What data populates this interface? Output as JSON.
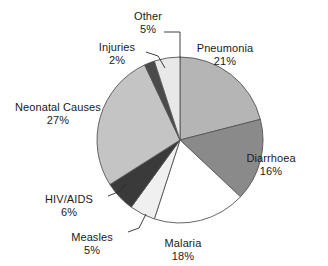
{
  "chart_data": {
    "type": "pie",
    "title": "",
    "subtitle": "",
    "xlabel": "",
    "ylabel": "",
    "legend_position": "none",
    "grid": false,
    "labels_show_percent": true,
    "categories": [
      "Pneumonia",
      "Diarrhoea",
      "Malaria",
      "Measles",
      "HIV/AIDS",
      "Neonatal Causes",
      "Injuries",
      "Other"
    ],
    "values": [
      21,
      16,
      18,
      5,
      6,
      27,
      2,
      5
    ],
    "units": "%",
    "total": 100,
    "start_angle_deg": 0,
    "direction": "clockwise",
    "slices": [
      {
        "name": "Pneumonia",
        "value": 21,
        "value_text": "21%",
        "color": "#b5b5b5",
        "start_deg": 0,
        "end_deg": 75.6,
        "label_x": 225,
        "label_y": 42,
        "leader": false
      },
      {
        "name": "Diarrhoea",
        "value": 16,
        "value_text": "16%",
        "color": "#8a8a8a",
        "start_deg": 75.6,
        "end_deg": 133.2,
        "label_x": 271,
        "label_y": 152,
        "leader": false
      },
      {
        "name": "Malaria",
        "value": 18,
        "value_text": "18%",
        "color": "#ffffff",
        "start_deg": 133.2,
        "end_deg": 198.0,
        "label_x": 183,
        "label_y": 237,
        "leader": false
      },
      {
        "name": "Measles",
        "value": 5,
        "value_text": "5%",
        "color": "#f0f0f0",
        "start_deg": 198.0,
        "end_deg": 216.0,
        "label_x": 92,
        "label_y": 231,
        "leader": true
      },
      {
        "name": "HIV/AIDS",
        "value": 6,
        "value_text": "6%",
        "color": "#3a3a3a",
        "start_deg": 216.0,
        "end_deg": 237.6,
        "label_x": 69,
        "label_y": 193,
        "leader": true
      },
      {
        "name": "Neonatal Causes",
        "value": 27,
        "value_text": "27%",
        "color": "#c4c4c4",
        "start_deg": 237.6,
        "end_deg": 334.8,
        "label_x": 58,
        "label_y": 101,
        "leader": false
      },
      {
        "name": "Injuries",
        "value": 2,
        "value_text": "2%",
        "color": "#4a4a4a",
        "start_deg": 334.8,
        "end_deg": 342.0,
        "label_x": 117,
        "label_y": 41,
        "leader": true
      },
      {
        "name": "Other",
        "value": 5,
        "value_text": "5%",
        "color": "#e8e8e8",
        "start_deg": 342.0,
        "end_deg": 360.0,
        "label_x": 148,
        "label_y": 10,
        "leader": true
      }
    ],
    "geometry": {
      "center_x": 180,
      "center_y": 140,
      "radius": 83
    },
    "style": {
      "outline_color": "#555555",
      "label_color": "#1a1a1a",
      "background": "#ffffff"
    }
  }
}
